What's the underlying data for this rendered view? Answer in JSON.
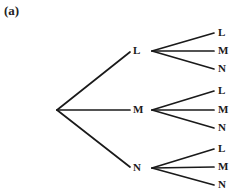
{
  "figure": {
    "caption": "(a)",
    "type": "probability-tree-diagram",
    "width": 237,
    "height": 195,
    "background_color": "#ffffff",
    "line_color": "#1a1a1a",
    "text_color": "#1a1a1a"
  },
  "tree": {
    "root": {
      "x": 57,
      "y": 110
    },
    "branches": [
      {
        "label": "L",
        "label_x": 133,
        "label_y": 51,
        "fan_apex_x": 152,
        "fan_apex_y": 51,
        "leaves": [
          {
            "label": "L",
            "label_x": 218,
            "label_y": 33,
            "end_x": 214,
            "end_y": 33
          },
          {
            "label": "M",
            "label_x": 218,
            "label_y": 51,
            "end_x": 214,
            "end_y": 51
          },
          {
            "label": "N",
            "label_x": 218,
            "label_y": 69,
            "end_x": 214,
            "end_y": 69
          }
        ]
      },
      {
        "label": "M",
        "label_x": 133,
        "label_y": 110,
        "fan_apex_x": 152,
        "fan_apex_y": 110,
        "leaves": [
          {
            "label": "L",
            "label_x": 218,
            "label_y": 91,
            "end_x": 214,
            "end_y": 91
          },
          {
            "label": "M",
            "label_x": 218,
            "label_y": 110,
            "end_x": 214,
            "end_y": 110
          },
          {
            "label": "N",
            "label_x": 218,
            "label_y": 128,
            "end_x": 214,
            "end_y": 128
          }
        ]
      },
      {
        "label": "N",
        "label_x": 133,
        "label_y": 168,
        "fan_apex_x": 152,
        "fan_apex_y": 168,
        "leaves": [
          {
            "label": "L",
            "label_x": 218,
            "label_y": 149,
            "end_x": 214,
            "end_y": 149
          },
          {
            "label": "M",
            "label_x": 218,
            "label_y": 167,
            "end_x": 214,
            "end_y": 167
          },
          {
            "label": "N",
            "label_x": 218,
            "label_y": 185,
            "end_x": 214,
            "end_y": 185
          }
        ]
      }
    ]
  }
}
